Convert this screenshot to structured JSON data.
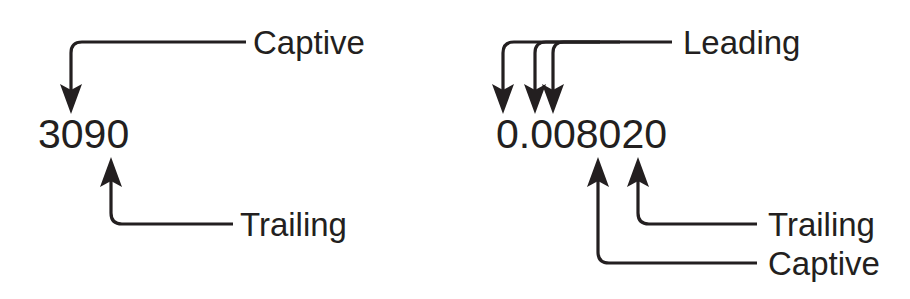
{
  "figure": {
    "background_color": "#ffffff",
    "ink_color": "#231f20"
  },
  "examples": [
    {
      "id": "example-left",
      "number": "3090",
      "annotations": [
        {
          "label": "Captive",
          "position": "above-right",
          "arrow_count": 1,
          "points_to": "0 (third digit)",
          "direction": "down"
        },
        {
          "label": "Trailing",
          "position": "below-right",
          "arrow_count": 1,
          "points_to": "0 (fourth digit)",
          "direction": "up"
        }
      ]
    },
    {
      "id": "example-right",
      "number": "0.008020",
      "annotations": [
        {
          "label": "Leading",
          "position": "above-right",
          "arrow_count": 3,
          "points_to": "0 . 0 0 (leading zeros)",
          "direction": "down"
        },
        {
          "label": "Trailing",
          "position": "below-right",
          "arrow_count": 1,
          "points_to": "0 (last digit)",
          "direction": "up"
        },
        {
          "label": "Captive",
          "position": "below-right",
          "arrow_count": 1,
          "points_to": "0 (captive zero)",
          "direction": "up"
        }
      ]
    }
  ],
  "labels": {
    "left_captive": "Captive",
    "left_trailing": "Trailing",
    "right_leading": "Leading",
    "right_trailing": "Trailing",
    "right_captive": "Captive"
  },
  "numbers": {
    "left": "3090",
    "right": "0.008020"
  }
}
